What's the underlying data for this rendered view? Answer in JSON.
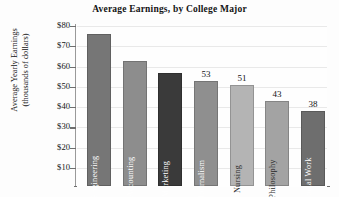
{
  "chart_data": {
    "type": "bar",
    "title": "Average Earnings, by College Major",
    "xlabel": "",
    "ylabel": "Average Yearly Earnings (thousands of dollars)",
    "ylabel_lines": [
      "Average Yearly Earnings",
      "(thousands of dollars)"
    ],
    "ylim": [
      0,
      80
    ],
    "ytick_labels": [
      "$80",
      "$70",
      "$60",
      "$50",
      "$40",
      "$30",
      "$20",
      "$10"
    ],
    "ytick_values": [
      80,
      70,
      60,
      50,
      40,
      30,
      20,
      10
    ],
    "grid": true,
    "legend": "none",
    "categories": [
      "Engineering",
      "Accounting",
      "Marketing",
      "Journalism",
      "Nursing",
      "Philosophy",
      "Social Work"
    ],
    "values": [
      76,
      63,
      57,
      53,
      51,
      43,
      38
    ],
    "value_labels": [
      "",
      "",
      "",
      "53",
      "51",
      "43",
      "38"
    ],
    "bar_colors": [
      "#767676",
      "#8d8d8d",
      "#3a3a3a",
      "#8f8f8f",
      "#b4b4b4",
      "#a3a3a3",
      "#6e6e6e"
    ],
    "bar_label_colors": [
      "#ffffff",
      "#ffffff",
      "#ffffff",
      "#ffffff",
      "#2a2a2a",
      "#2a2a2a",
      "#ffffff"
    ],
    "bars": [
      {
        "category": "Engineering",
        "value": 76,
        "label": "Engineering",
        "value_label": "",
        "color": "#767676",
        "label_color": "#ffffff"
      },
      {
        "category": "Accounting",
        "value": 63,
        "label": "Accounting",
        "value_label": "",
        "color": "#8d8d8d",
        "label_color": "#ffffff"
      },
      {
        "category": "Marketing",
        "value": 57,
        "label": "Marketing",
        "value_label": "",
        "color": "#3a3a3a",
        "label_color": "#ffffff"
      },
      {
        "category": "Journalism",
        "value": 53,
        "label": "Journalism",
        "value_label": "53",
        "color": "#8f8f8f",
        "label_color": "#ffffff"
      },
      {
        "category": "Nursing",
        "value": 51,
        "label": "Nursing",
        "value_label": "51",
        "color": "#b4b4b4",
        "label_color": "#2a2a2a"
      },
      {
        "category": "Philosophy",
        "value": 43,
        "label": "Philosophy",
        "value_label": "43",
        "color": "#a3a3a3",
        "label_color": "#2a2a2a"
      },
      {
        "category": "Social Work",
        "value": 38,
        "label": "Social Work",
        "value_label": "38",
        "color": "#6e6e6e",
        "label_color": "#ffffff"
      }
    ]
  }
}
